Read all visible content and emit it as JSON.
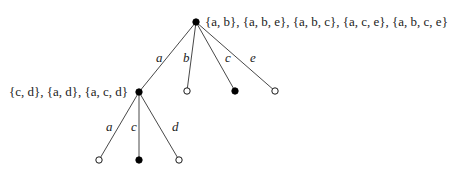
{
  "diagram": {
    "type": "tree",
    "nodes": {
      "root": {
        "filled": true,
        "annotation": "{a, b}, {a, b, e}, {a, b, c}, {a, c, e}, {a, b, c, e}"
      },
      "n_a": {
        "filled": true,
        "annotation": "{c, d}, {a, d}, {a, c, d}"
      },
      "n_b": {
        "filled": false
      },
      "n_c": {
        "filled": true
      },
      "n_e": {
        "filled": false
      },
      "n_aa": {
        "filled": false
      },
      "n_ac": {
        "filled": true
      },
      "n_ad": {
        "filled": false
      }
    },
    "edges": [
      {
        "from": "root",
        "to": "n_a",
        "label": "a"
      },
      {
        "from": "root",
        "to": "n_b",
        "label": "b"
      },
      {
        "from": "root",
        "to": "n_c",
        "label": "c"
      },
      {
        "from": "root",
        "to": "n_e",
        "label": "e"
      },
      {
        "from": "n_a",
        "to": "n_aa",
        "label": "a"
      },
      {
        "from": "n_a",
        "to": "n_ac",
        "label": "c"
      },
      {
        "from": "n_a",
        "to": "n_ad",
        "label": "d"
      }
    ]
  }
}
